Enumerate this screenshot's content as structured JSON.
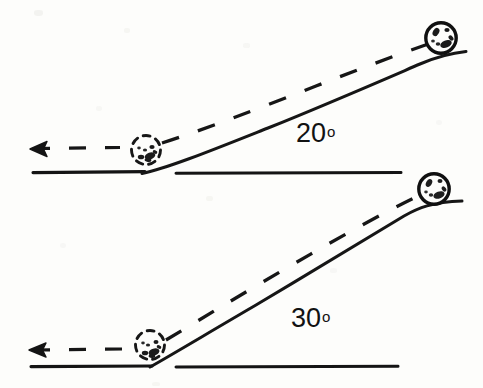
{
  "figure": {
    "type": "physics-diagram",
    "background_color": "#fdfdfb",
    "ink_color": "#121212",
    "panels": [
      {
        "id": "panel-top",
        "angle_label": "20",
        "degree_symbol": "o",
        "angle_degrees": 20,
        "ground_line": {
          "y": 172,
          "left_segment": [
            33,
            145
          ],
          "right_segment": [
            176,
            401
          ]
        },
        "incline": {
          "from": [
            145,
            172
          ],
          "to": [
            448,
            55
          ],
          "apex_flat_to": [
            466,
            50
          ]
        },
        "dashed_trajectory": {
          "from": [
            30,
            148
          ],
          "to": [
            452,
            35
          ]
        },
        "ball_top": {
          "cx": 441,
          "cy": 38,
          "r": 16,
          "style": "solid-speckled"
        },
        "ball_base": {
          "cx": 146,
          "cy": 150,
          "r": 15,
          "style": "dashed-speckled"
        },
        "arrow": {
          "tip": [
            30,
            149
          ],
          "direction": "left"
        }
      },
      {
        "id": "panel-bottom",
        "angle_label": "30",
        "degree_symbol": "o",
        "angle_degrees": 30,
        "ground_line": {
          "y": 366,
          "left_segment": [
            31,
            152
          ],
          "right_segment": [
            176,
            398
          ]
        },
        "incline": {
          "from": [
            152,
            366
          ],
          "to": [
            437,
            204
          ],
          "apex_flat_to": [
            462,
            200
          ]
        },
        "dashed_trajectory": {
          "from": [
            29,
            350
          ],
          "to": [
            440,
            185
          ]
        },
        "ball_top": {
          "cx": 434,
          "cy": 189,
          "r": 16,
          "style": "solid-speckled"
        },
        "ball_base": {
          "cx": 150,
          "cy": 345,
          "r": 15,
          "style": "dashed-speckled"
        },
        "arrow": {
          "tip": [
            29,
            350
          ],
          "direction": "left"
        }
      }
    ]
  },
  "labels": {
    "top_angle_num": "20",
    "top_angle_deg": "o",
    "bottom_angle_num": "30",
    "bottom_angle_deg": "o"
  }
}
